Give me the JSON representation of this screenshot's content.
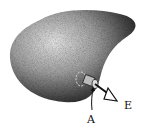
{
  "diagram": {
    "labels": {
      "field": "E",
      "point": "A"
    },
    "colors": {
      "background": "#ffffff",
      "conductor_dark": "#2a2a2a",
      "conductor_light": "#e8e8e8",
      "ink": "#111111"
    }
  }
}
